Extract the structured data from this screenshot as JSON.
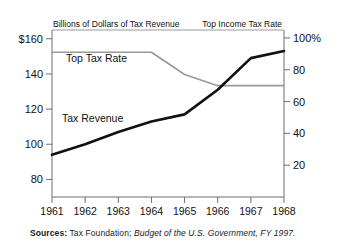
{
  "footnote": {
    "label": "Sources:",
    "plain": " Tax Foundation; ",
    "italic": "Budget of the U.S. Government, FY 1997."
  },
  "chart_data": {
    "type": "line",
    "title": "",
    "subtitle": "",
    "left_axis_title": "Billions of Dollars of Tax Revenue",
    "right_axis_title": "Top Income Tax Rate",
    "xlabel": "",
    "ylabel": "Billions of Dollars of Tax Revenue",
    "y2label": "Top Income Tax Rate",
    "grid": false,
    "legend_position": "inline-annotations",
    "categories": [
      "1961",
      "1962",
      "1963",
      "1964",
      "1965",
      "1966",
      "1967",
      "1968"
    ],
    "x": [
      1961,
      1962,
      1963,
      1964,
      1965,
      1966,
      1967,
      1968
    ],
    "ylim": [
      70,
      165
    ],
    "y2lim": [
      0,
      105
    ],
    "yticks": [
      "$160",
      "140",
      "120",
      "100",
      "80"
    ],
    "ytick_values": [
      160,
      140,
      120,
      100,
      80
    ],
    "y2ticks": [
      "100%",
      "80",
      "60",
      "40",
      "20"
    ],
    "y2tick_values": [
      100,
      80,
      60,
      40,
      20
    ],
    "series": [
      {
        "name": "Tax Revenue",
        "axis": "left",
        "color": "#111111",
        "width": 2.6,
        "label_text": "Tax Revenue",
        "values": [
          94,
          100,
          107,
          113,
          117,
          131,
          149,
          153
        ]
      },
      {
        "name": "Top Tax Rate",
        "axis": "right",
        "color": "#999999",
        "width": 1.6,
        "label_text": "Top Tax Rate",
        "values": [
          91,
          91,
          91,
          91,
          77,
          70,
          70,
          70
        ]
      }
    ],
    "annotations": [
      {
        "text": "Top Tax Rate",
        "x": 1961.6,
        "y_px": 62
      },
      {
        "text": "Tax Revenue",
        "x": 1961.6,
        "y_px": 122
      }
    ]
  }
}
